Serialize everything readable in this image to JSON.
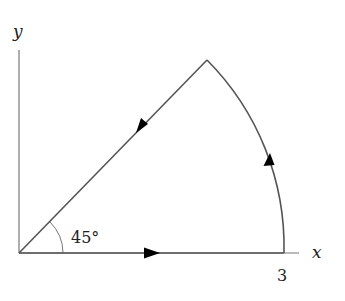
{
  "diagram": {
    "type": "closed contour (circular sector)",
    "axes": {
      "x_label": "x",
      "y_label": "y"
    },
    "labels": {
      "angle": "45°",
      "radius_tick": "3"
    },
    "contour": {
      "segments": [
        {
          "name": "segment along x-axis",
          "from": "origin",
          "to": "(3, 0)",
          "direction": "rightward"
        },
        {
          "name": "circular arc",
          "from": "(3, 0)",
          "to": "angle 45°",
          "direction": "counterclockwise"
        },
        {
          "name": "segment along 45° line",
          "from": "arc endpoint",
          "to": "origin",
          "direction": "toward origin"
        }
      ],
      "radius": 3,
      "angle_deg": 45
    },
    "colors": {
      "line": "#555555",
      "arrow": "#000000",
      "text": "#222222"
    }
  }
}
